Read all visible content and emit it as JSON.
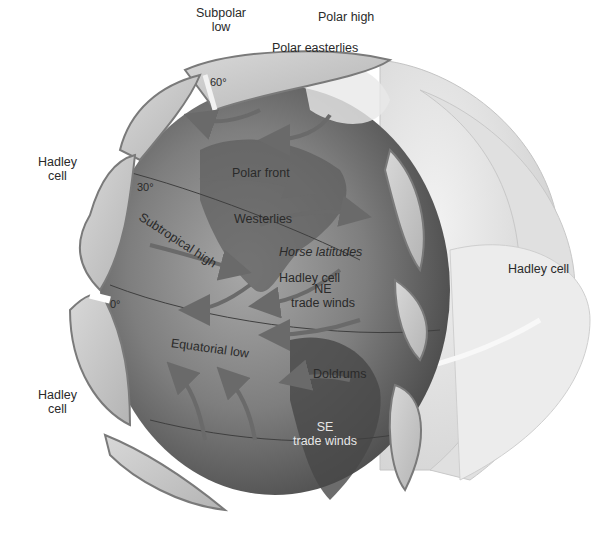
{
  "diagram": {
    "colors": {
      "background": "#ffffff",
      "globe_dark": "#5a5a5a",
      "globe_mid": "#8c8c8c",
      "cell_fill": "#c9c9c9",
      "cell_outline": "#7a7a7a",
      "arrow": "#6e6e6e",
      "label": "#2a2a2a",
      "outer_shell": "#e4e4e4"
    },
    "labels": {
      "subpolar_low": [
        "Subpolar",
        "low"
      ],
      "polar_high": "Polar high",
      "lat_60": "60°",
      "polar_easterlies": "Polar easterlies",
      "hadley_cell_upper_left": [
        "Hadley",
        "cell"
      ],
      "lat_30": "30°",
      "subtropical_high": "Subtropical high",
      "polar_front": "Polar front",
      "westerlies": "Westerlies",
      "horse_latitudes": "Horse latitudes",
      "hadley_cell_inner": "Hadley cell",
      "ne_trade_winds": [
        "NE",
        "trade winds"
      ],
      "hadley_cell_right": "Hadley cell",
      "lat_0": "0°",
      "equatorial_low": "Equatorial low",
      "doldrums": "Doldrums",
      "hadley_cell_lower_left": [
        "Hadley",
        "cell"
      ],
      "se_trade_winds": [
        "SE",
        "trade winds"
      ]
    }
  }
}
